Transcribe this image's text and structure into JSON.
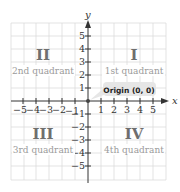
{
  "diagram": {
    "axes": {
      "x_label": "x",
      "y_label": "y",
      "x_ticks": [
        "−5",
        "−4",
        "−3",
        "−2",
        "−1",
        "1",
        "2",
        "3",
        "4",
        "5"
      ],
      "y_ticks": [
        "5",
        "4",
        "3",
        "2",
        "1",
        "−1",
        "−2",
        "−3",
        "−4",
        "−5"
      ]
    },
    "quadrants": [
      {
        "numeral": "II",
        "label": "2nd quadrant"
      },
      {
        "numeral": "I",
        "label": "1st quadrant"
      },
      {
        "numeral": "III",
        "label": "3rd quadrant"
      },
      {
        "numeral": "IV",
        "label": "4th quadrant"
      }
    ],
    "callout": {
      "text": "Origin (0, 0)"
    },
    "colors": {
      "grid": "#dcdcdc",
      "axis": "#333333",
      "numeral": "#6e6e6e",
      "quadrant_label": "#9a9a9a",
      "callout_bg": "#e6e6e6",
      "callout_text": "#222222"
    }
  }
}
